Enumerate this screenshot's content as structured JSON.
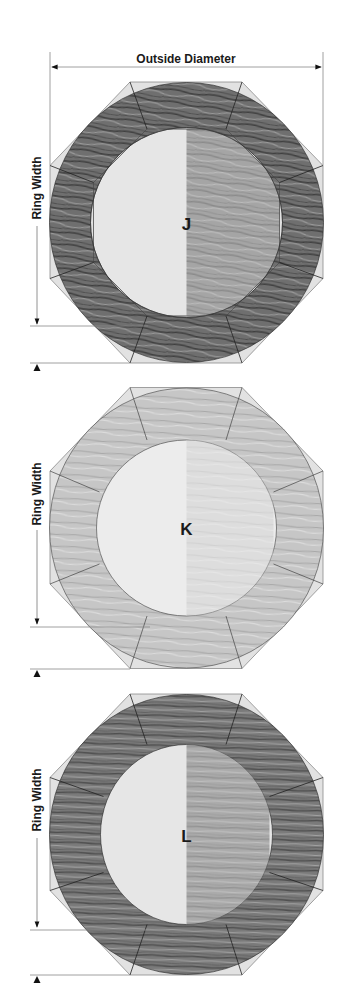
{
  "diagram": {
    "dimension_labels": {
      "outside_diameter": "Outside Diameter",
      "ring_width": "Ring Width"
    },
    "panels": [
      {
        "label": "J",
        "wood_tone": "dark",
        "fill": "#6f6f6f",
        "grain": "#3f3f3f",
        "highlight": "#9a9a9a"
      },
      {
        "label": "K",
        "wood_tone": "light",
        "fill": "#c6c6c6",
        "grain": "#a8a8a8",
        "highlight": "#dcdcdc"
      },
      {
        "label": "L",
        "wood_tone": "medium-dark",
        "fill": "#7a7a7a",
        "grain": "#4f4f4f",
        "highlight": "#a2a2a2"
      }
    ],
    "colors": {
      "octagon_fill": "#e2e2e2",
      "outline": "#333333",
      "dimension_line": "#777777",
      "text": "#1a1a1a"
    }
  }
}
